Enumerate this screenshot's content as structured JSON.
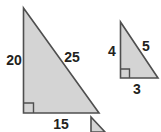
{
  "figure": {
    "background_color": "#ffffff",
    "fill_color": "#d4d4d4",
    "stroke_color": "#4f4f4f",
    "label_color": "#231f20",
    "triangles": [
      {
        "name": "large-triangle",
        "vertical_leg_label": "20",
        "hypotenuse_label": "25",
        "horizontal_leg_label": "15",
        "right_angle_label": "right angle"
      },
      {
        "name": "small-triangle",
        "vertical_leg_label": "4",
        "hypotenuse_label": "5",
        "horizontal_leg_label": "3",
        "right_angle_label": "right angle"
      }
    ],
    "fragment": {
      "name": "clipped-triangle-fragment"
    }
  }
}
